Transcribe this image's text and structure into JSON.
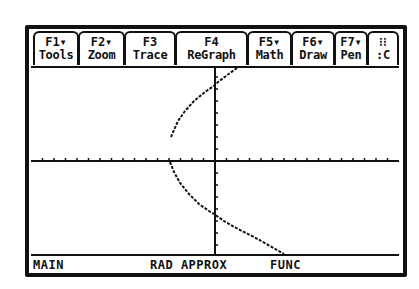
{
  "app": {
    "title": "TI-89 Graph Screen"
  },
  "toolbar": {
    "tabs": [
      {
        "fkey": "F1▾",
        "label": "Tools"
      },
      {
        "fkey": "F2▾",
        "label": "Zoom"
      },
      {
        "fkey": "F3",
        "label": "Trace"
      },
      {
        "fkey": "F4",
        "label": "ReGraph"
      },
      {
        "fkey": "F5▾",
        "label": "Math"
      },
      {
        "fkey": "F6▾",
        "label": "Draw"
      },
      {
        "fkey": "F7▾",
        "label": "Pen"
      },
      {
        "fkey": "⁝⁝",
        "label": ":C"
      }
    ]
  },
  "graph": {
    "x_axis_y": 161,
    "y_axis_x": 215,
    "curve_color": "#111111",
    "axis_color": "#111111",
    "upper_branch": [
      [
        237,
        68
      ],
      [
        226,
        76
      ],
      [
        218,
        82
      ],
      [
        215,
        85
      ],
      [
        205,
        92
      ],
      [
        194,
        101
      ],
      [
        185,
        111
      ],
      [
        178,
        121
      ],
      [
        174,
        130
      ],
      [
        171,
        137
      ]
    ],
    "lower_branch": [
      [
        170,
        162
      ],
      [
        174,
        172
      ],
      [
        180,
        183
      ],
      [
        189,
        194
      ],
      [
        199,
        204
      ],
      [
        209,
        211
      ],
      [
        214,
        214
      ],
      [
        224,
        221
      ],
      [
        238,
        229
      ],
      [
        254,
        237
      ],
      [
        270,
        246
      ],
      [
        284,
        254
      ]
    ]
  },
  "status": {
    "folder": "MAIN",
    "mode": "RAD APPROX",
    "graph_mode": "FUNC"
  }
}
